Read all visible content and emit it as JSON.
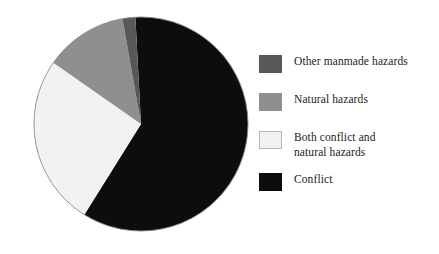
{
  "chart_data": {
    "type": "pie",
    "title": "",
    "subtitle": "",
    "xlabel": "",
    "ylabel": "",
    "grid": false,
    "legend_position": "right",
    "categories": [
      "Conflict",
      "Both conflict and natural hazards",
      "Natural hazards",
      "Other manmade hazards"
    ],
    "values": [
      57,
      26,
      12,
      5
    ],
    "units": "percent",
    "start_angle_deg": -3,
    "direction": "clockwise",
    "colors": [
      "#0d0d0d",
      "#f2f2f2",
      "#8f8f8f",
      "#585858"
    ],
    "slices": [
      {
        "label": "Conflict",
        "value": 57,
        "color": "#0d0d0d",
        "start_angle_deg": -3,
        "end_angle_deg": 212
      },
      {
        "label": "Both conflict and natural hazards",
        "value": 26,
        "color": "#f2f2f2",
        "start_angle_deg": 212,
        "end_angle_deg": 305
      },
      {
        "label": "Natural hazards",
        "value": 12,
        "color": "#8f8f8f",
        "start_angle_deg": 305,
        "end_angle_deg": 350
      },
      {
        "label": "Other manmade hazards",
        "value": 5,
        "color": "#585858",
        "start_angle_deg": 350,
        "end_angle_deg": 357
      }
    ]
  },
  "pie": {
    "center_x": 141,
    "center_y": 124,
    "radius": 107,
    "outline_color": "#8a8a8a"
  },
  "legend": {
    "items": [
      {
        "label": "Other manmade hazards",
        "color": "#585858",
        "border": "#585858"
      },
      {
        "label": "Natural hazards",
        "color": "#8f8f8f",
        "border": "#8f8f8f"
      },
      {
        "label": "Both conflict and\nnatural hazards",
        "color": "#f2f2f2",
        "border": "#b9b9b9"
      },
      {
        "label": "Conflict",
        "color": "#0d0d0d",
        "border": "#0d0d0d"
      }
    ]
  }
}
